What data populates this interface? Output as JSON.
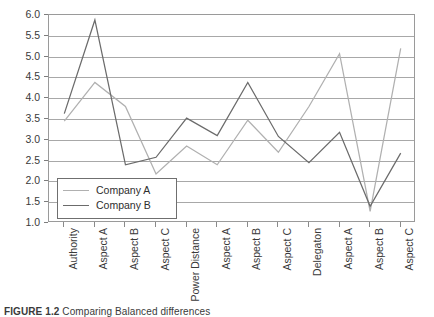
{
  "chart_data": {
    "type": "line",
    "title": "",
    "xlabel": "",
    "ylabel": "",
    "ylim": [
      1.0,
      6.0
    ],
    "ytick_step": 0.5,
    "yticks": [
      "6.0",
      "5.5",
      "5.0",
      "4.5",
      "4.0",
      "3.5",
      "3.0",
      "2.5",
      "2.0",
      "1.5",
      "1.0"
    ],
    "grid": "horizontal",
    "legend_position": "inside lower-left",
    "categories": [
      "Authority",
      "Aspect A",
      "Aspect B",
      "Aspect C",
      "Power Distance",
      "Aspect A",
      "Aspect B",
      "Aspect C",
      "Delegaton",
      "Aspect A",
      "Aspect B",
      "Aspect C"
    ],
    "series": [
      {
        "name": "Company A",
        "color": "#b0b0b0",
        "values": [
          3.45,
          4.38,
          3.8,
          2.18,
          2.85,
          2.4,
          3.47,
          2.7,
          3.8,
          5.07,
          1.28,
          5.2
        ]
      },
      {
        "name": "Company B",
        "color": "#6b6b6b",
        "values": [
          3.63,
          5.88,
          2.4,
          2.58,
          3.52,
          3.1,
          4.38,
          3.08,
          2.45,
          3.18,
          1.4,
          2.68
        ]
      }
    ]
  },
  "legend": {
    "items": [
      {
        "label": "Company A"
      },
      {
        "label": "Company B"
      }
    ]
  },
  "caption": {
    "label": "FIGURE 1.2",
    "text": "Comparing Balanced differences"
  },
  "colors": {
    "series_a": "#b0b0b0",
    "series_b": "#6b6b6b",
    "gridline": "#a8a8a8",
    "frame": "#9a9a9a",
    "text": "#3a3a3a"
  }
}
